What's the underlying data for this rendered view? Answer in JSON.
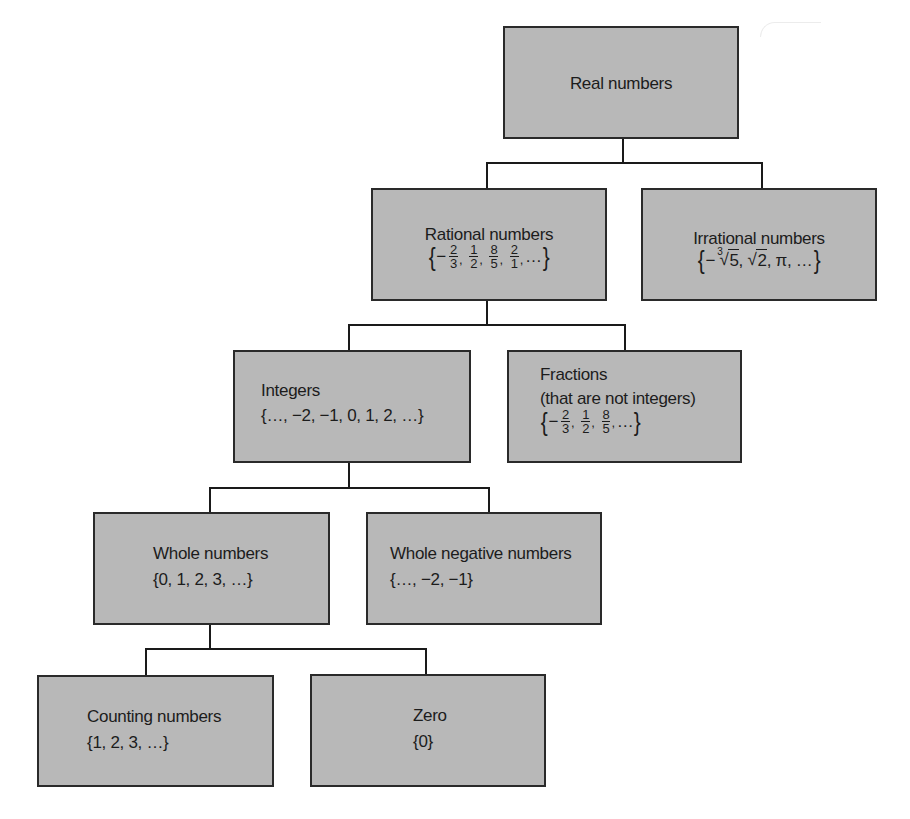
{
  "diagram": {
    "nodes": {
      "real": {
        "label": "Real numbers"
      },
      "rational": {
        "label": "Rational numbers",
        "examples": [
          {
            "sign": "−",
            "num": "2",
            "den": "3"
          },
          {
            "sign": "",
            "num": "1",
            "den": "2"
          },
          {
            "sign": "",
            "num": "8",
            "den": "5"
          },
          {
            "sign": "",
            "num": "2",
            "den": "1"
          }
        ],
        "ellipsis": "…"
      },
      "irrational": {
        "label": "Irrational numbers",
        "examples": {
          "first_sign": "−",
          "first_index": "3",
          "first_radicand": "5",
          "second_radicand": "2",
          "third": "π",
          "ellipsis": "…"
        }
      },
      "integers": {
        "label": "Integers",
        "set": "{…, −2, −1, 0, 1, 2, …}"
      },
      "fractions": {
        "label": "Fractions",
        "sublabel": "(that are not integers)",
        "examples": [
          {
            "sign": "−",
            "num": "2",
            "den": "3"
          },
          {
            "sign": "",
            "num": "1",
            "den": "2"
          },
          {
            "sign": "",
            "num": "8",
            "den": "5"
          }
        ],
        "ellipsis": "…"
      },
      "whole": {
        "label": "Whole numbers",
        "set": "{0, 1, 2, 3, …}"
      },
      "whole_negative": {
        "label": "Whole negative numbers",
        "set": "{…, −2, −1}"
      },
      "counting": {
        "label": "Counting numbers",
        "set": "{1, 2, 3, …}"
      },
      "zero": {
        "label": "Zero",
        "set": "{0}"
      }
    },
    "edges": [
      [
        "real",
        "rational"
      ],
      [
        "real",
        "irrational"
      ],
      [
        "rational",
        "integers"
      ],
      [
        "rational",
        "fractions"
      ],
      [
        "integers",
        "whole"
      ],
      [
        "integers",
        "whole_negative"
      ],
      [
        "whole",
        "counting"
      ],
      [
        "whole",
        "zero"
      ]
    ],
    "colors": {
      "box_fill": "#b8b8b8",
      "box_border": "#2a2a2a",
      "line": "#1a1a1a",
      "text": "#1c1c1c"
    }
  }
}
